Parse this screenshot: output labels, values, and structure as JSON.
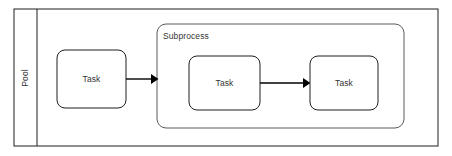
{
  "diagram": {
    "type": "bpmn-process",
    "colors": {
      "background": "#ffffff",
      "pool_stroke": "#1f1f1f",
      "task_stroke": "#1f1f1f",
      "subprocess_stroke": "#5a5a5a",
      "shape_fill": "#ffffff",
      "text": "#333333",
      "flow": "#000000"
    },
    "pool": {
      "label": "Pool",
      "label_orientation": "vertical-bottom-to-top",
      "x": 14,
      "y": 9,
      "width": 424,
      "height": 137,
      "header_divider_x": 37
    },
    "subprocess": {
      "label": "Subprocess",
      "x": 157,
      "y": 24,
      "width": 247,
      "height": 104,
      "corner_radius": 9,
      "label_x": 163,
      "label_y": 37
    },
    "tasks": [
      {
        "id": "task-1",
        "label": "Task",
        "x": 57,
        "y": 50,
        "width": 69,
        "height": 58,
        "corner_radius": 8,
        "container": "pool"
      },
      {
        "id": "task-2",
        "label": "Task",
        "x": 189,
        "y": 56,
        "width": 71,
        "height": 54,
        "corner_radius": 8,
        "container": "subprocess"
      },
      {
        "id": "task-3",
        "label": "Task",
        "x": 310,
        "y": 56,
        "width": 68,
        "height": 54,
        "corner_radius": 8,
        "container": "subprocess"
      }
    ],
    "flows": [
      {
        "id": "flow-1",
        "from": "task-1",
        "to": "subprocess",
        "x1": 126,
        "y1": 79,
        "x2": 157,
        "y2": 79,
        "arrowhead": "solid-filled-triangle"
      },
      {
        "id": "flow-2",
        "from": "task-2",
        "to": "task-3",
        "x1": 260,
        "y1": 83,
        "x2": 310,
        "y2": 83,
        "arrowhead": "solid-filled-triangle"
      }
    ]
  }
}
